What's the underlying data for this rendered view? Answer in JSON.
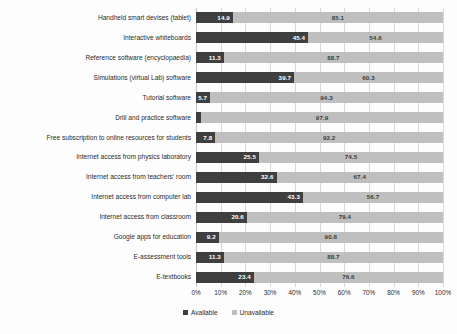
{
  "chart_data": {
    "type": "bar",
    "orientation": "horizontal",
    "stacked": true,
    "stack_mode": "percent",
    "title": "",
    "subtitle": "",
    "xlabel": "",
    "ylabel": "",
    "xlim": [
      0,
      100
    ],
    "grid": true,
    "legend_position": "bottom",
    "xticks": [
      "0%",
      "10%",
      "20%",
      "30%",
      "40%",
      "50%",
      "60%",
      "70%",
      "80%",
      "90%",
      "100%"
    ],
    "xtick_values": [
      0,
      10,
      20,
      30,
      40,
      50,
      60,
      70,
      80,
      90,
      100
    ],
    "categories": [
      "Handheld smart devises (tablet)",
      "Interactive whiteboards",
      "Reference software (encyclopaedia)",
      "Simulations (virtual Lab) software",
      "Tutorial software",
      "Drill and practice software",
      "Free subscription to online resources for students",
      "Internet access from physics laboratory",
      "Internet access from teachers' room",
      "Internet access from computer lab",
      "Internet access from classroom",
      "Google apps for education",
      "E-assessment tools",
      "E-textbooks"
    ],
    "series": [
      {
        "name": "Available",
        "color": "#3F3F3F",
        "values": [
          14.9,
          45.4,
          11.3,
          39.7,
          5.7,
          2.1,
          7.8,
          25.5,
          32.6,
          43.3,
          20.6,
          9.2,
          11.3,
          23.4
        ]
      },
      {
        "name": "Unavailable",
        "color": "#BFBFBF",
        "values": [
          85.1,
          54.6,
          88.7,
          60.3,
          94.3,
          97.9,
          92.2,
          74.5,
          67.4,
          56.7,
          79.4,
          90.8,
          88.7,
          76.6
        ]
      }
    ]
  }
}
